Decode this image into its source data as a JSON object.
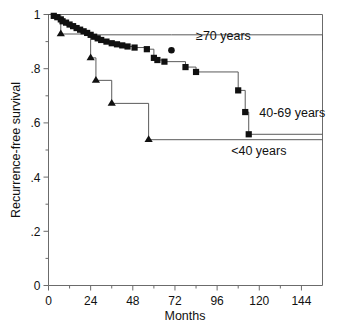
{
  "chart_data": {
    "type": "line",
    "subtype": "kaplan-meier-step",
    "title": "",
    "xlabel": "Months",
    "ylabel": "Recurrence-free survival",
    "xlim": [
      0,
      156
    ],
    "ylim": [
      0,
      1
    ],
    "grid": false,
    "legend_position": "inline-right",
    "x_ticks": [
      0,
      24,
      48,
      72,
      96,
      120,
      144
    ],
    "x_tick_labels": [
      "0",
      "24",
      "48",
      "72",
      "96",
      "120",
      "144"
    ],
    "x_minor_ticks": [
      12,
      36,
      60,
      84,
      108,
      132
    ],
    "y_ticks": [
      0,
      0.2,
      0.4,
      0.6,
      0.8,
      1
    ],
    "y_tick_labels": [
      "0",
      ".2",
      ".4",
      ".6",
      ".8",
      "1"
    ],
    "y_minor_ticks": [
      0.1,
      0.3,
      0.5,
      0.7,
      0.9
    ],
    "series": [
      {
        "name": "≥70 years",
        "label": "≥70 years",
        "marker": "circle",
        "color": "#101010",
        "x": [
          0,
          5,
          7,
          10,
          12,
          15,
          18,
          22,
          24,
          70,
          156
        ],
        "y": [
          1.0,
          0.985,
          0.972,
          0.96,
          0.955,
          0.945,
          0.935,
          0.928,
          0.925,
          0.925,
          0.868
        ],
        "censor_points": [
          {
            "x": 70,
            "y": 0.868
          }
        ]
      },
      {
        "name": "40-69 years",
        "label": "40-69 years",
        "marker": "square",
        "color": "#101010",
        "x": [
          0,
          3,
          5,
          7,
          8,
          10,
          12,
          14,
          16,
          18,
          20,
          22,
          24,
          26,
          28,
          30,
          33,
          36,
          39,
          42,
          45,
          49,
          56,
          60,
          62,
          66,
          78,
          84,
          108,
          112,
          114,
          156
        ],
        "y": [
          1.0,
          0.995,
          0.99,
          0.982,
          0.975,
          0.97,
          0.963,
          0.957,
          0.95,
          0.944,
          0.938,
          0.932,
          0.925,
          0.918,
          0.912,
          0.906,
          0.9,
          0.894,
          0.89,
          0.886,
          0.882,
          0.878,
          0.872,
          0.84,
          0.832,
          0.826,
          0.806,
          0.788,
          0.72,
          0.64,
          0.558,
          0.558
        ],
        "censor_points": [
          {
            "x": 3,
            "y": 0.995
          },
          {
            "x": 5,
            "y": 0.99
          },
          {
            "x": 7,
            "y": 0.982
          },
          {
            "x": 8,
            "y": 0.975
          },
          {
            "x": 10,
            "y": 0.97
          },
          {
            "x": 12,
            "y": 0.963
          },
          {
            "x": 14,
            "y": 0.957
          },
          {
            "x": 16,
            "y": 0.95
          },
          {
            "x": 18,
            "y": 0.944
          },
          {
            "x": 20,
            "y": 0.938
          },
          {
            "x": 22,
            "y": 0.932
          },
          {
            "x": 24,
            "y": 0.925
          },
          {
            "x": 26,
            "y": 0.918
          },
          {
            "x": 28,
            "y": 0.912
          },
          {
            "x": 30,
            "y": 0.906
          },
          {
            "x": 33,
            "y": 0.9
          },
          {
            "x": 36,
            "y": 0.894
          },
          {
            "x": 39,
            "y": 0.89
          },
          {
            "x": 42,
            "y": 0.886
          },
          {
            "x": 45,
            "y": 0.882
          },
          {
            "x": 49,
            "y": 0.878
          },
          {
            "x": 56,
            "y": 0.872
          },
          {
            "x": 60,
            "y": 0.84
          },
          {
            "x": 62,
            "y": 0.832
          },
          {
            "x": 66,
            "y": 0.826
          },
          {
            "x": 78,
            "y": 0.806
          },
          {
            "x": 84,
            "y": 0.788
          },
          {
            "x": 108,
            "y": 0.72
          },
          {
            "x": 112,
            "y": 0.64
          },
          {
            "x": 114,
            "y": 0.558
          }
        ]
      },
      {
        "name": "<40 years",
        "label": "<40 years",
        "marker": "triangle",
        "color": "#101010",
        "x": [
          0,
          7,
          24,
          27,
          36,
          57,
          156
        ],
        "y": [
          1.0,
          0.928,
          0.84,
          0.757,
          0.672,
          0.538,
          0.538
        ],
        "censor_points": [
          {
            "x": 7,
            "y": 0.928
          },
          {
            "x": 24,
            "y": 0.84
          },
          {
            "x": 27,
            "y": 0.757
          },
          {
            "x": 36,
            "y": 0.672
          },
          {
            "x": 57,
            "y": 0.538
          }
        ]
      }
    ],
    "annotations": [
      {
        "text": "≥70 years",
        "x": 84,
        "y": 0.905,
        "series": "≥70 years"
      },
      {
        "text": "40-69 years",
        "x": 120,
        "y": 0.62,
        "series": "40-69 years"
      },
      {
        "text": "<40 years",
        "x": 104,
        "y": 0.48,
        "series": "<40 years"
      }
    ]
  },
  "axes": {
    "x_label": "Months",
    "y_label": "Recurrence-free survival"
  }
}
